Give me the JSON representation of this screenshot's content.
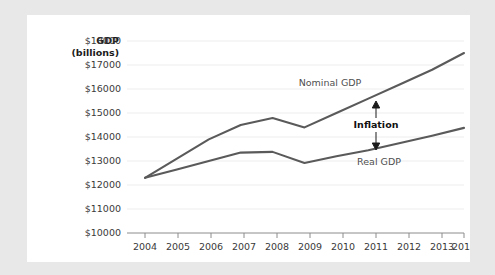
{
  "chart_data": {
    "type": "line",
    "title": "",
    "ylabel_line1": "GDP",
    "ylabel_line2": "(billions)",
    "xlabel": "",
    "x": [
      2004,
      2005,
      2006,
      2007,
      2008,
      2009,
      2010,
      2011,
      2012,
      2013,
      2014
    ],
    "categories": [
      "2004",
      "2005",
      "2006",
      "2007",
      "2008",
      "2009",
      "2010",
      "2011",
      "2012",
      "2013",
      "2014"
    ],
    "ylim": [
      10000,
      18000
    ],
    "ytick_values": [
      10000,
      11000,
      12000,
      13000,
      14000,
      15000,
      16000,
      17000,
      18000
    ],
    "ytick_labels": [
      "$10000",
      "$11000",
      "$12000",
      "$13000",
      "$14000",
      "$15000",
      "$16000",
      "$17000",
      "$18000"
    ],
    "grid": true,
    "legend_position": "inline-annotations",
    "series": [
      {
        "name": "Nominal GDP",
        "label": "Nominal GDP",
        "values": [
          12300,
          13100,
          13900,
          14500,
          14790,
          14400,
          15000,
          15600,
          16200,
          16800,
          17500
        ]
      },
      {
        "name": "Real GDP",
        "label": "Real GDP",
        "values": [
          12300,
          12650,
          13000,
          13350,
          13380,
          12920,
          13200,
          13450,
          13750,
          14050,
          14380
        ]
      }
    ],
    "annotations": [
      {
        "name": "inflation-gap",
        "label": "Inflation",
        "at_x": 2011,
        "from_value": 15600,
        "to_value": 13450,
        "style": "double-arrow"
      }
    ]
  },
  "labels": {
    "nominal_gdp": "Nominal GDP",
    "real_gdp": "Real GDP",
    "inflation": "Inflation"
  }
}
